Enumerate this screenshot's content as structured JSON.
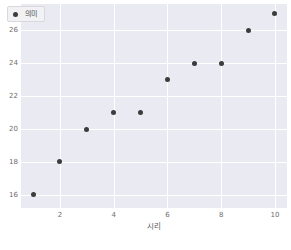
{
  "chart_data": {
    "type": "scatter",
    "title": "",
    "xlabel": "시리",
    "ylabel": "",
    "legend_position": "upper left",
    "grid": true,
    "xlim": [
      0.55,
      10.45
    ],
    "ylim": [
      15.2,
      27.6
    ],
    "xticks": [
      2,
      4,
      6,
      8,
      10
    ],
    "yticks": [
      16,
      18,
      20,
      22,
      24,
      26
    ],
    "xtick_labels": [
      "2",
      "4",
      "6",
      "8",
      "10"
    ],
    "ytick_labels": [
      "16",
      "18",
      "20",
      "22",
      "24",
      "26"
    ],
    "series": [
      {
        "name": "의미",
        "marker": "circle",
        "color": "#3c3c3c",
        "x": [
          1,
          2,
          3,
          4,
          5,
          6,
          7,
          8,
          9,
          10
        ],
        "y": [
          16,
          18,
          20,
          21,
          21,
          23,
          24,
          24,
          26,
          27
        ],
        "points": [
          {
            "x": 1,
            "y": 16
          },
          {
            "x": 2,
            "y": 18
          },
          {
            "x": 3,
            "y": 20
          },
          {
            "x": 4,
            "y": 21
          },
          {
            "x": 5,
            "y": 21
          },
          {
            "x": 6,
            "y": 23
          },
          {
            "x": 7,
            "y": 24
          },
          {
            "x": 8,
            "y": 24
          },
          {
            "x": 9,
            "y": 26
          },
          {
            "x": 10,
            "y": 27
          }
        ]
      }
    ]
  },
  "legend": {
    "label": "의미"
  },
  "axes": {
    "xlabel": "시리"
  },
  "colors": {
    "figure_background": "#ffffff",
    "plot_background": "#eaeaf2",
    "gridline": "#ffffff",
    "marker": "#3c3c3c",
    "tick_text": "#6e6e6e",
    "label_text": "#595959"
  }
}
